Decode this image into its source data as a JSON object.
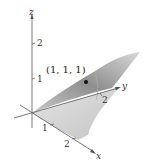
{
  "figure": {
    "type": "3d-surface-plot",
    "axes": {
      "x": {
        "label": "x",
        "ticks": [
          "1",
          "2"
        ]
      },
      "y": {
        "label": "y",
        "ticks": [
          "2"
        ]
      },
      "z": {
        "label": "z",
        "ticks": [
          "1",
          "2"
        ]
      }
    },
    "point": {
      "label": "(1, 1, 1)",
      "coords": [
        1,
        1,
        1
      ]
    },
    "colors": {
      "surface_dark": "#8a8a8a",
      "surface_mid": "#b5b5b5",
      "surface_light": "#dcdcdc",
      "axis": "#555555",
      "point": "#111111"
    }
  }
}
